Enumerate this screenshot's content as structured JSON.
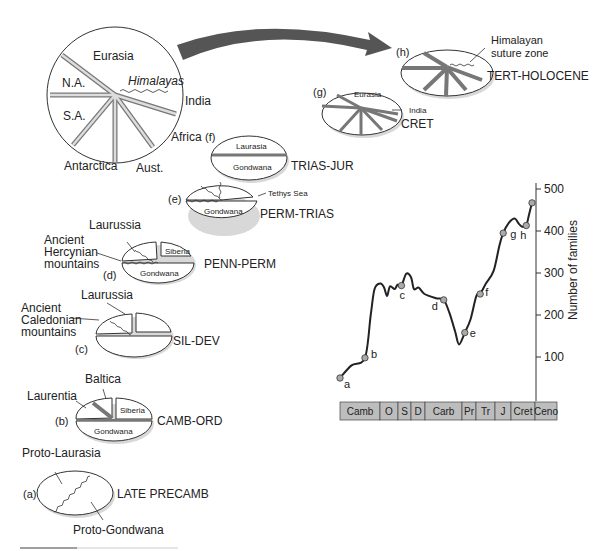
{
  "stages": [
    {
      "id": "a",
      "tag": "(a)",
      "period": "LATE PRECAMB",
      "labels": [
        "Proto-Laurasia",
        "Proto-Gondwana"
      ]
    },
    {
      "id": "b",
      "tag": "(b)",
      "period": "CAMB-ORD",
      "labels": [
        "Baltica",
        "Laurentia",
        "Siberia",
        "Gondwana"
      ]
    },
    {
      "id": "c",
      "tag": "(c)",
      "period": "SIL-DEV",
      "labels": [
        "Laurussia",
        "Ancient",
        "Caledonian",
        "mountains"
      ]
    },
    {
      "id": "d",
      "tag": "(d)",
      "period": "PENN-PERM",
      "labels": [
        "Laurussia",
        "Ancient",
        "Hercynian",
        "mountains",
        "Siberia",
        "Gondwana"
      ]
    },
    {
      "id": "e",
      "tag": "(e)",
      "period": "PERM-TRIAS",
      "labels": [
        "Tethys Sea",
        "Gondwana"
      ]
    },
    {
      "id": "f",
      "tag": "(f)",
      "period": "TRIAS-JUR",
      "labels": [
        "Laurasia",
        "Gondwana"
      ]
    },
    {
      "id": "g",
      "tag": "(g)",
      "period": "CRET",
      "labels": [
        "Eurasia",
        "India"
      ]
    },
    {
      "id": "h",
      "tag": "(h)",
      "period": "TERT-HOLOCENE",
      "labels": [
        "Himalayan",
        "suture zone"
      ]
    }
  ],
  "big_globe": {
    "labels": [
      "Eurasia",
      "N.A.",
      "Himalayas",
      "India",
      "S.A.",
      "Africa",
      "Antarctica",
      "Aust."
    ]
  },
  "chart_data": {
    "type": "line",
    "title": "",
    "ylabel": "Number of families",
    "xlabel": "",
    "ylim": [
      0,
      500
    ],
    "yticks": [
      100,
      200,
      300,
      400,
      500
    ],
    "grid": false,
    "period_bar": [
      "Camb",
      "O",
      "S",
      "D",
      "Carb",
      "Pr",
      "Tr",
      "J",
      "Cret",
      "Ceno"
    ],
    "points": [
      {
        "label": "a",
        "x": 0.0,
        "y": 50
      },
      {
        "label": "b",
        "x": 0.13,
        "y": 98
      },
      {
        "label": "c",
        "x": 0.32,
        "y": 270
      },
      {
        "label": "d",
        "x": 0.54,
        "y": 236
      },
      {
        "label": "e",
        "x": 0.65,
        "y": 158
      },
      {
        "label": "f",
        "x": 0.73,
        "y": 250
      },
      {
        "label": "g",
        "x": 0.85,
        "y": 395
      },
      {
        "label": "h",
        "x": 0.97,
        "y": 413
      },
      {
        "label": "",
        "x": 1.0,
        "y": 467
      }
    ],
    "curve": [
      [
        0.0,
        50
      ],
      [
        0.06,
        80
      ],
      [
        0.13,
        98
      ],
      [
        0.16,
        200
      ],
      [
        0.18,
        262
      ],
      [
        0.21,
        275
      ],
      [
        0.23,
        265
      ],
      [
        0.245,
        245
      ],
      [
        0.26,
        268
      ],
      [
        0.285,
        262
      ],
      [
        0.3,
        272
      ],
      [
        0.32,
        270
      ],
      [
        0.345,
        298
      ],
      [
        0.37,
        290
      ],
      [
        0.385,
        262
      ],
      [
        0.41,
        265
      ],
      [
        0.44,
        250
      ],
      [
        0.5,
        240
      ],
      [
        0.54,
        236
      ],
      [
        0.57,
        205
      ],
      [
        0.6,
        160
      ],
      [
        0.62,
        130
      ],
      [
        0.65,
        158
      ],
      [
        0.68,
        190
      ],
      [
        0.71,
        245
      ],
      [
        0.73,
        250
      ],
      [
        0.76,
        275
      ],
      [
        0.8,
        305
      ],
      [
        0.83,
        365
      ],
      [
        0.85,
        395
      ],
      [
        0.88,
        420
      ],
      [
        0.91,
        430
      ],
      [
        0.93,
        418
      ],
      [
        0.95,
        410
      ],
      [
        0.97,
        413
      ],
      [
        0.985,
        440
      ],
      [
        1.0,
        467
      ]
    ]
  }
}
